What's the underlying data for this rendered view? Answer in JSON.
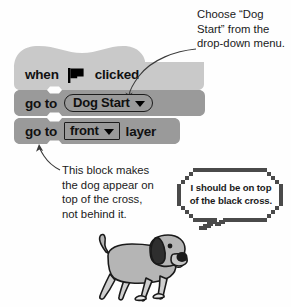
{
  "figure": {
    "background_color": "#fefefe",
    "block_colors": {
      "hat_block": "#c9c9c9",
      "command_block": "#9a9a9a",
      "input_fill": "#9a9a9a",
      "outline": "#1c1c1c"
    }
  },
  "script": {
    "hat_block": {
      "prefix_label": "when",
      "icon": "green-flag-icon",
      "suffix_label": "clicked"
    },
    "blocks": [
      {
        "prefix_label": "go to",
        "input_type": "oval-dropdown",
        "input_value": "Dog Start",
        "suffix_label": ""
      },
      {
        "prefix_label": "go to",
        "input_type": "rect-dropdown",
        "input_value": "front",
        "suffix_label": "layer"
      }
    ]
  },
  "annotations": {
    "top": {
      "lines": [
        "Choose “Dog",
        "Start” from the",
        "drop-down menu."
      ]
    },
    "bottom": {
      "lines": [
        "This block makes",
        "the dog appear on",
        "top of the cross,",
        "not behind it."
      ]
    }
  },
  "speech_bubble": {
    "lines": [
      "I should be on top",
      "of the black cross."
    ]
  },
  "illustration": {
    "name": "dog-sprite",
    "body_color": "#b5b5b5",
    "ear_color": "#2e2e2e",
    "nose_color": "#1a1a1a"
  }
}
